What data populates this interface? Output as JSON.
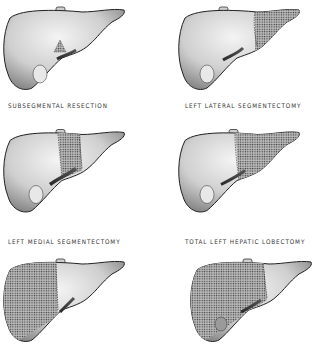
{
  "figure": {
    "panels": [
      {
        "id": "subsegmental",
        "label": "SUBSEGMENTAL RESECTION",
        "resected_region": "small wedge segment"
      },
      {
        "id": "left-lateral",
        "label": "LEFT LATERAL SEGMENTECTOMY",
        "resected_region": "left lateral segment"
      },
      {
        "id": "left-medial",
        "label": "LEFT MEDIAL SEGMENTECTOMY",
        "resected_region": "left medial segment"
      },
      {
        "id": "total-left",
        "label": "TOTAL LEFT HEPATIC LOBECTOMY",
        "resected_region": "entire left lobe"
      },
      {
        "id": "right-lobectomy",
        "label": "",
        "resected_region": "right lobe"
      },
      {
        "id": "extended-right",
        "label": "",
        "resected_region": "right lobe plus medial segment"
      }
    ]
  },
  "colors": {
    "background": "#ffffff",
    "liver_fill": "#d8d8d8",
    "liver_outline": "#2a2a2a",
    "stipple": "#555555",
    "caption": "#333333"
  }
}
